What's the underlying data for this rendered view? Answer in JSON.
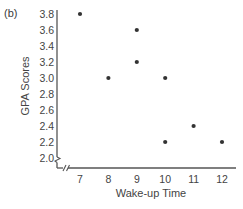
{
  "panel_label": "(b)",
  "chart_data": {
    "type": "scatter",
    "title": "",
    "xlabel": "Wake-up Time",
    "ylabel": "GPA Scores",
    "x_ticks": [
      7,
      8,
      9,
      10,
      11,
      12
    ],
    "y_ticks": [
      "2.0",
      "2.2",
      "2.4",
      "2.6",
      "2.8",
      "3.0",
      "3.2",
      "3.4",
      "3.6",
      "3.8"
    ],
    "xlim": [
      6.2,
      12.5
    ],
    "ylim": [
      1.9,
      3.8
    ],
    "grid": false,
    "axis_breaks": [
      "x",
      "y"
    ],
    "points": [
      {
        "x": 7,
        "y": 3.8
      },
      {
        "x": 8,
        "y": 3.0
      },
      {
        "x": 9,
        "y": 3.6
      },
      {
        "x": 9,
        "y": 3.2
      },
      {
        "x": 10,
        "y": 3.0
      },
      {
        "x": 10,
        "y": 2.2
      },
      {
        "x": 11,
        "y": 2.4
      },
      {
        "x": 12,
        "y": 2.2
      }
    ],
    "marker_color": "#333333"
  }
}
